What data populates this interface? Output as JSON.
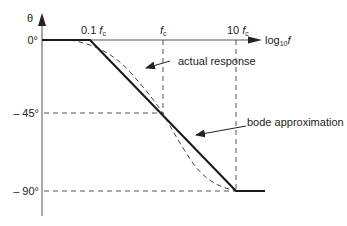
{
  "diagram": {
    "type": "bode-phase-plot",
    "y_axis": {
      "symbol": "θ",
      "ticks": [
        "0°",
        "– 45°",
        "– 90°"
      ]
    },
    "x_axis": {
      "label_prefix": "log",
      "label_sub": "10",
      "label_var": "f",
      "ticks": [
        {
          "coef": "0.1 ",
          "var": "f",
          "sub": "c"
        },
        {
          "coef": "",
          "var": "f",
          "sub": "c"
        },
        {
          "coef": "10 ",
          "var": "f",
          "sub": "c"
        }
      ]
    },
    "annotations": {
      "actual": "actual response",
      "bode": "bode approximation"
    },
    "colors": {
      "line": "#222222",
      "dash": "#555555"
    }
  }
}
